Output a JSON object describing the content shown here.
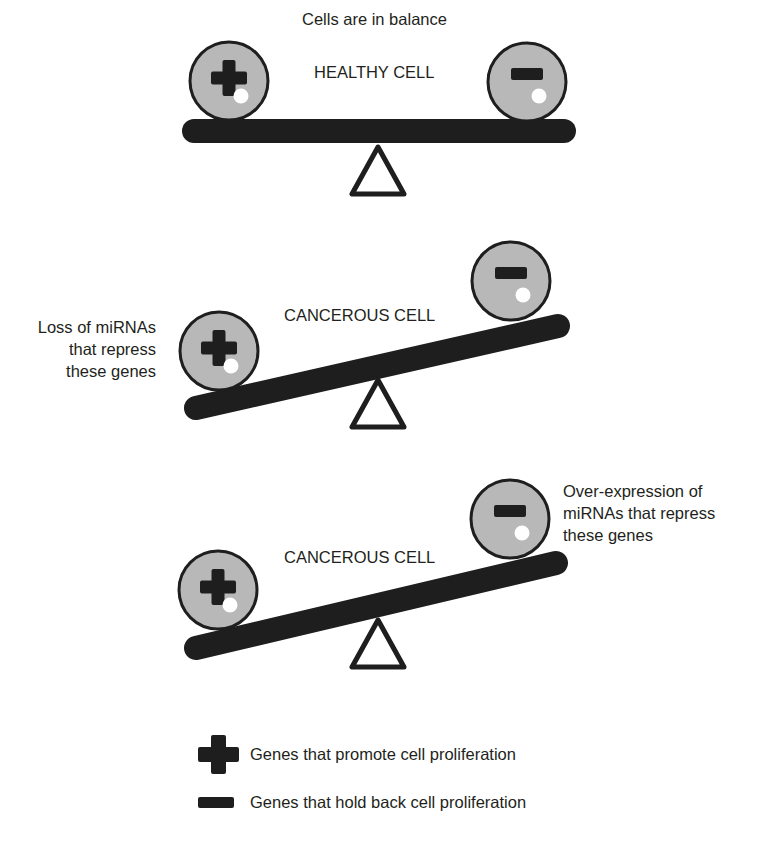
{
  "title": "Cells are in balance",
  "colors": {
    "cell_fill": "#b8b8b8",
    "outline": "#1e1e1e",
    "bar": "#1e1e1e",
    "highlight": "#ffffff"
  },
  "panels": [
    {
      "label": "HEALTHY CELL",
      "state": "balanced",
      "left_cell": "plus-icon",
      "right_cell": "minus-icon"
    },
    {
      "label": "CANCEROUS CELL",
      "state": "tilted-left-down",
      "left_cell": "plus-icon",
      "right_cell": "minus-icon",
      "annotation": [
        "Loss of miRNAs",
        "that repress",
        "these genes"
      ]
    },
    {
      "label": "CANCEROUS CELL",
      "state": "tilted-left-down",
      "left_cell": "plus-icon",
      "right_cell": "minus-icon",
      "annotation": [
        "Over-expression of",
        "miRNAs that repress",
        "these genes"
      ]
    }
  ],
  "legend": [
    {
      "icon": "plus-icon",
      "label": "Genes that promote cell proliferation"
    },
    {
      "icon": "minus-icon",
      "label": "Genes that hold back cell proliferation"
    }
  ]
}
